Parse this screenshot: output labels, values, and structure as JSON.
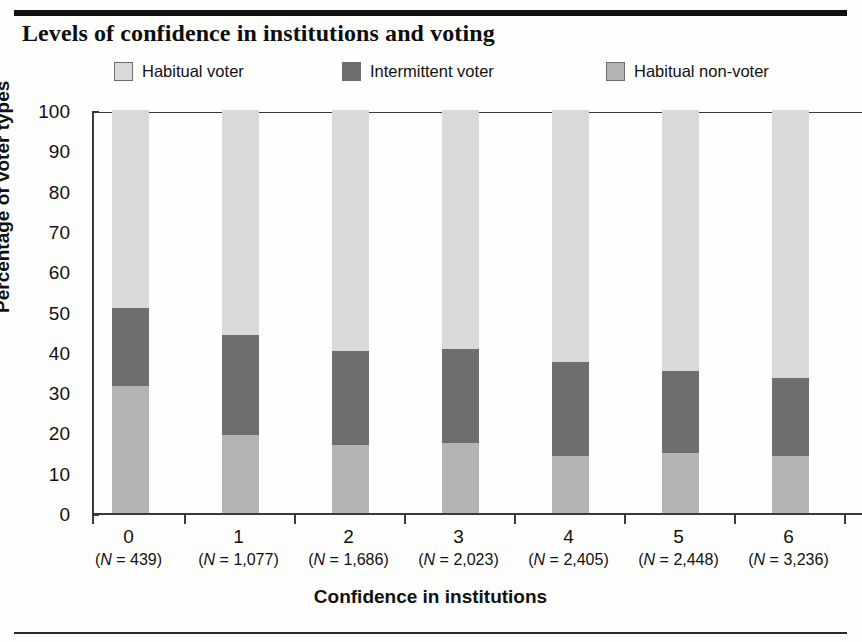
{
  "figure": {
    "ghost_text_top": "",
    "title": "Levels of confidence in institutions and voting",
    "rule_color": "#111111"
  },
  "legend": {
    "position": "top",
    "items": [
      {
        "label": "Habitual voter",
        "color": "#d9d9d9",
        "swatch_name": "habitual-voter-swatch"
      },
      {
        "label": "Intermittent voter",
        "color": "#6e6e6e",
        "swatch_name": "intermittent-voter-swatch"
      },
      {
        "label": "Habitual non-voter",
        "color": "#b4b4b4",
        "swatch_name": "habitual-non-voter-swatch"
      }
    ]
  },
  "axes": {
    "y_title": "Percentage of voter types",
    "y_ticks": [
      "0",
      "10",
      "20",
      "30",
      "40",
      "50",
      "60",
      "70",
      "80",
      "90",
      "100"
    ],
    "x_title": "Confidence in institutions",
    "x_categories": [
      "0",
      "1",
      "2",
      "3",
      "4",
      "5",
      "6"
    ],
    "x_sublabels": [
      "(N = 439)",
      "(N = 1,077)",
      "(N = 1,686)",
      "(N = 2,023)",
      "(N = 2,405)",
      "(N = 2,448)",
      "(N = 3,236)"
    ]
  },
  "chart_data": {
    "type": "bar",
    "subtype": "stacked-100-percent",
    "title": "Levels of confidence in institutions and voting",
    "xlabel": "Confidence in institutions",
    "ylabel": "Percentage of voter types",
    "ylim": [
      0,
      100
    ],
    "ytick_step": 10,
    "grid": false,
    "legend_position": "top",
    "categories": [
      "0",
      "1",
      "2",
      "3",
      "4",
      "5",
      "6"
    ],
    "category_counts": [
      439,
      1077,
      1686,
      2023,
      2405,
      2448,
      3236
    ],
    "stack_order_bottom_to_top": [
      "Habitual non-voter",
      "Intermittent voter",
      "Habitual voter"
    ],
    "series": [
      {
        "name": "Habitual non-voter",
        "color": "#b4b4b4",
        "values": [
          31.5,
          19.4,
          17.0,
          17.3,
          14.2,
          14.9,
          14.1
        ]
      },
      {
        "name": "Intermittent voter",
        "color": "#6e6e6e",
        "values": [
          19.4,
          24.8,
          23.2,
          23.4,
          23.2,
          20.4,
          19.4
        ]
      },
      {
        "name": "Habitual voter",
        "color": "#d9d9d9",
        "values": [
          49.1,
          55.8,
          59.8,
          59.3,
          62.6,
          64.7,
          66.5
        ]
      }
    ],
    "cumulative_tops": {
      "Habitual non-voter": [
        31.5,
        19.4,
        17.0,
        17.3,
        14.2,
        14.9,
        14.1
      ],
      "Intermittent voter": [
        50.9,
        44.2,
        40.2,
        40.7,
        37.4,
        35.3,
        33.5
      ],
      "Habitual voter": [
        100,
        100,
        100,
        100,
        100,
        100,
        100
      ]
    }
  }
}
